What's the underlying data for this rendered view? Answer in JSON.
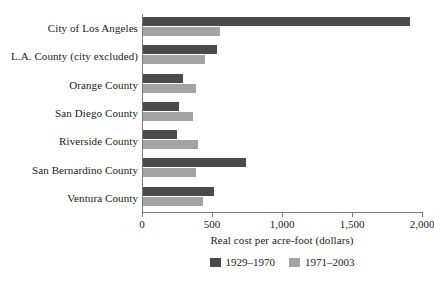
{
  "chart_data": {
    "type": "bar",
    "orientation": "horizontal",
    "title": "",
    "xlabel": "Real cost per acre-foot (dollars)",
    "ylabel": "",
    "xlim": [
      0,
      2000
    ],
    "xticks": [
      0,
      500,
      1000,
      1500,
      2000
    ],
    "xtick_labels": [
      "0",
      "500",
      "1,000",
      "1,500",
      "2,000"
    ],
    "grid": false,
    "legend_position": "bottom",
    "categories": [
      "City of Los Angeles",
      "L.A. County (city excluded)",
      "Orange County",
      "San Diego County",
      "Riverside County",
      "San Bernardino County",
      "Ventura County"
    ],
    "series": [
      {
        "name": "1929–1970",
        "color": "#4a4a4a",
        "values": [
          1910,
          530,
          285,
          260,
          240,
          735,
          505
        ]
      },
      {
        "name": "1971–2003",
        "color": "#a3a3a3",
        "values": [
          550,
          440,
          380,
          360,
          395,
          380,
          430
        ]
      }
    ]
  },
  "colors": {
    "series_1929_1970": "#4a4a4a",
    "series_1971_2003": "#a3a3a3",
    "axis": "#7b7b7b",
    "text": "#1a1a1a",
    "background": "#ffffff"
  }
}
